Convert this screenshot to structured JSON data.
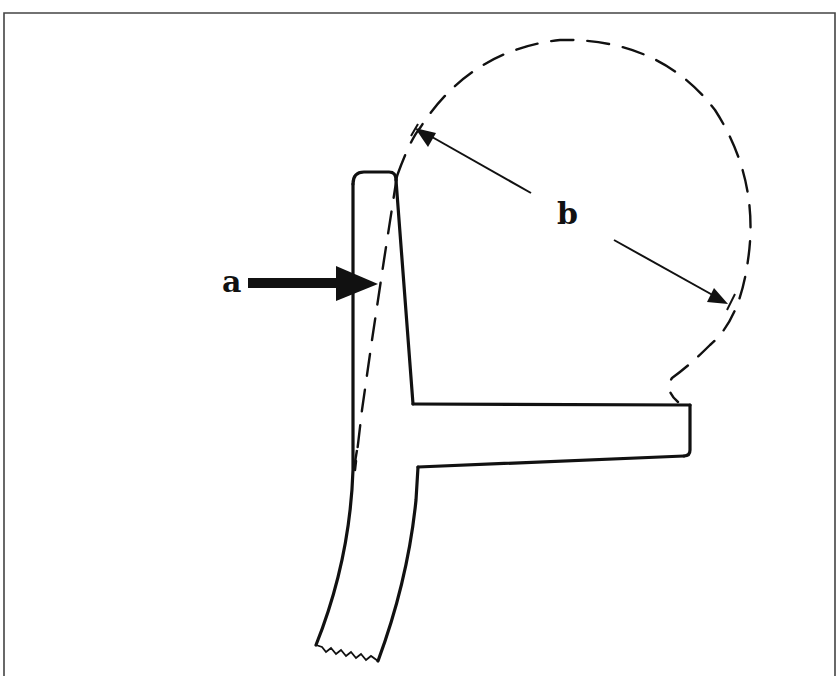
{
  "figure": {
    "type": "line-drawing",
    "labels": {
      "a": "a",
      "b": "b"
    },
    "annotations": [
      {
        "id": "a",
        "meaning": "arrow pointing to dashed cut line along trunk"
      },
      {
        "id": "b",
        "meaning": "double-headed dimension arrow spanning the dashed circle (diameter)"
      }
    ],
    "colors": {
      "ink": "#111111",
      "background": "#ffffff"
    }
  }
}
